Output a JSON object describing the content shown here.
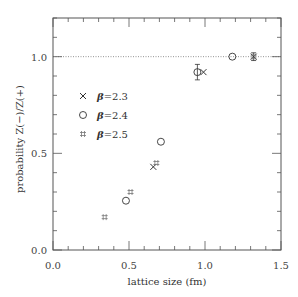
{
  "chart_data": {
    "type": "scatter",
    "title": "",
    "xlabel": "lattice size (fm)",
    "ylabel": "probability  Z(−)/Z(+)",
    "xlim": [
      0.0,
      1.5
    ],
    "ylim": [
      0.0,
      1.2
    ],
    "xticks": [
      "0.0",
      "0.5",
      "1.0",
      "1.5"
    ],
    "yticks": [
      "0.0",
      "0.5",
      "1.0"
    ],
    "grid": false,
    "reference_line": {
      "y": 1.0,
      "style": "dotted"
    },
    "legend_position": "upper left",
    "series": [
      {
        "name": "β=2.3",
        "marker": "x",
        "label_beta": "β",
        "label_value": "=2.3",
        "points": [
          {
            "x": 0.66,
            "y": 0.43,
            "err": 0.0
          },
          {
            "x": 0.99,
            "y": 0.92,
            "err": 0.0
          },
          {
            "x": 1.32,
            "y": 1.0,
            "err": 0.02
          }
        ]
      },
      {
        "name": "β=2.4",
        "marker": "circle",
        "label_beta": "β",
        "label_value": "=2.4",
        "points": [
          {
            "x": 0.48,
            "y": 0.255,
            "err": 0.0
          },
          {
            "x": 0.71,
            "y": 0.56,
            "err": 0.0
          },
          {
            "x": 0.95,
            "y": 0.92,
            "err": 0.04
          },
          {
            "x": 1.18,
            "y": 1.0,
            "err": 0.0
          }
        ]
      },
      {
        "name": "β=2.5",
        "marker": "hash",
        "label_beta": "β",
        "label_value": "=2.5",
        "points": [
          {
            "x": 0.34,
            "y": 0.17,
            "err": 0.0
          },
          {
            "x": 0.51,
            "y": 0.3,
            "err": 0.0
          },
          {
            "x": 0.68,
            "y": 0.45,
            "err": 0.0
          },
          {
            "x": 1.32,
            "y": 1.0,
            "err": 0.0
          }
        ]
      }
    ]
  }
}
